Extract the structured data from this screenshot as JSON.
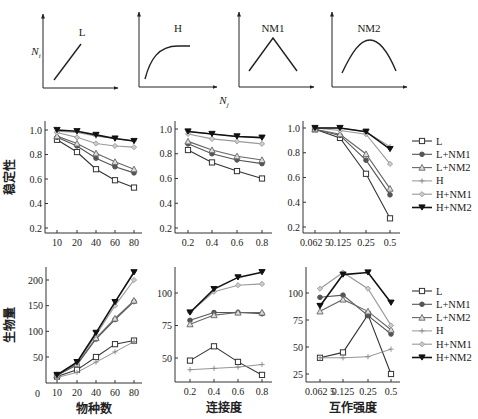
{
  "top_panels": {
    "ylabel": "N_i",
    "xlabel": "N_j",
    "panels": [
      {
        "label": "L",
        "shape": "linear"
      },
      {
        "label": "H",
        "shape": "saturating"
      },
      {
        "label": "NM1",
        "shape": "triangle"
      },
      {
        "label": "NM2",
        "shape": "hump"
      }
    ]
  },
  "legend": [
    {
      "name": "L",
      "marker": "square-open",
      "color": "#333333"
    },
    {
      "name": "L+NM1",
      "marker": "circle",
      "color": "#555555"
    },
    {
      "name": "L+NM2",
      "marker": "triangle-open",
      "color": "#666666"
    },
    {
      "name": "H",
      "marker": "cross",
      "color": "#888888"
    },
    {
      "name": "H+NM1",
      "marker": "diamond",
      "color": "#999999"
    },
    {
      "name": "H+NM2",
      "marker": "triangle-down",
      "color": "#111111"
    }
  ],
  "chart_data": [
    {
      "type": "line",
      "title": "",
      "xlabel": "",
      "ylabel": "稳定性",
      "categories": [
        "10",
        "20",
        "40",
        "60",
        "80"
      ],
      "ylim": [
        0.2,
        1.05
      ],
      "yticks": [
        "0.2",
        "0.4",
        "0.6",
        "0.8",
        "1.0"
      ],
      "series": [
        {
          "name": "L",
          "values": [
            0.92,
            0.82,
            0.68,
            0.59,
            0.53
          ]
        },
        {
          "name": "L+NM1",
          "values": [
            0.94,
            0.87,
            0.77,
            0.7,
            0.65
          ]
        },
        {
          "name": "L+NM2",
          "values": [
            0.95,
            0.89,
            0.81,
            0.74,
            0.68
          ]
        },
        {
          "name": "H",
          "values": [
            0.99,
            0.98,
            0.95,
            0.93,
            0.91
          ]
        },
        {
          "name": "H+NM1",
          "values": [
            0.98,
            0.94,
            0.89,
            0.87,
            0.86
          ]
        },
        {
          "name": "H+NM2",
          "values": [
            1.0,
            0.99,
            0.96,
            0.93,
            0.91
          ]
        }
      ]
    },
    {
      "type": "line",
      "title": "",
      "xlabel": "",
      "ylabel": "",
      "categories": [
        "0.2",
        "0.4",
        "0.6",
        "0.8"
      ],
      "ylim": [
        0.2,
        1.05
      ],
      "yticks": [
        "0.2",
        "0.4",
        "0.6",
        "0.8",
        "1.0"
      ],
      "series": [
        {
          "name": "L",
          "values": [
            0.83,
            0.73,
            0.66,
            0.6
          ]
        },
        {
          "name": "L+NM1",
          "values": [
            0.88,
            0.8,
            0.75,
            0.72
          ]
        },
        {
          "name": "L+NM2",
          "values": [
            0.9,
            0.83,
            0.78,
            0.75
          ]
        },
        {
          "name": "H",
          "values": [
            0.98,
            0.96,
            0.94,
            0.93
          ]
        },
        {
          "name": "H+NM1",
          "values": [
            0.96,
            0.92,
            0.9,
            0.88
          ]
        },
        {
          "name": "H+NM2",
          "values": [
            0.98,
            0.96,
            0.94,
            0.93
          ]
        }
      ]
    },
    {
      "type": "line",
      "title": "",
      "xlabel": "",
      "ylabel": "",
      "categories": [
        "0.062 5",
        "0.125",
        "0.25",
        "0.5"
      ],
      "ylim": [
        0.2,
        1.05
      ],
      "yticks": [
        "0.2",
        "0.4",
        "0.6",
        "0.8",
        "1.0"
      ],
      "series": [
        {
          "name": "L",
          "values": [
            0.99,
            0.92,
            0.63,
            0.27
          ]
        },
        {
          "name": "L+NM1",
          "values": [
            0.99,
            0.94,
            0.74,
            0.46
          ]
        },
        {
          "name": "L+NM2",
          "values": [
            0.99,
            0.95,
            0.79,
            0.51
          ]
        },
        {
          "name": "H",
          "values": [
            1.0,
            1.0,
            0.97,
            0.85
          ]
        },
        {
          "name": "H+NM1",
          "values": [
            1.0,
            0.98,
            0.95,
            0.71
          ]
        },
        {
          "name": "H+NM2",
          "values": [
            1.0,
            1.0,
            0.97,
            0.83
          ]
        }
      ]
    },
    {
      "type": "line",
      "title": "",
      "xlabel": "物种数",
      "ylabel": "生物量",
      "categories": [
        "10",
        "20",
        "40",
        "60",
        "80"
      ],
      "ylim": [
        0,
        225
      ],
      "yticks": [
        "50",
        "100",
        "150",
        "200"
      ],
      "origin_label": "0",
      "series": [
        {
          "name": "L",
          "values": [
            12,
            25,
            50,
            75,
            82
          ]
        },
        {
          "name": "L+NM1",
          "values": [
            14,
            35,
            85,
            123,
            158
          ]
        },
        {
          "name": "L+NM2",
          "values": [
            15,
            36,
            87,
            125,
            160
          ]
        },
        {
          "name": "H",
          "values": [
            10,
            20,
            40,
            60,
            80
          ]
        },
        {
          "name": "H+NM1",
          "values": [
            15,
            38,
            93,
            150,
            200
          ]
        },
        {
          "name": "H+NM2",
          "values": [
            15,
            40,
            97,
            157,
            215
          ]
        }
      ]
    },
    {
      "type": "line",
      "title": "",
      "xlabel": "连接度",
      "ylabel": "",
      "categories": [
        "0.2",
        "0.4",
        "0.6",
        "0.8"
      ],
      "ylim": [
        32,
        120
      ],
      "yticks": [
        "50",
        "75",
        "100"
      ],
      "series": [
        {
          "name": "L",
          "values": [
            48,
            59,
            47,
            37
          ]
        },
        {
          "name": "L+NM1",
          "values": [
            79,
            85,
            85,
            84
          ]
        },
        {
          "name": "L+NM2",
          "values": [
            76,
            83,
            85,
            85
          ]
        },
        {
          "name": "H",
          "values": [
            41,
            42,
            43,
            45
          ]
        },
        {
          "name": "H+NM1",
          "values": [
            85,
            101,
            106,
            107
          ]
        },
        {
          "name": "H+NM2",
          "values": [
            85,
            103,
            112,
            116
          ]
        }
      ]
    },
    {
      "type": "line",
      "title": "",
      "xlabel": "互作强度",
      "ylabel": "",
      "categories": [
        "0.062 5",
        "0.125",
        "0.25",
        "0.5"
      ],
      "ylim": [
        20,
        125
      ],
      "yticks": [
        "25",
        "50",
        "75",
        "100"
      ],
      "series": [
        {
          "name": "L",
          "values": [
            40,
            45,
            80,
            25
          ]
        },
        {
          "name": "L+NM1",
          "values": [
            96,
            98,
            79,
            62
          ]
        },
        {
          "name": "L+NM2",
          "values": [
            83,
            94,
            83,
            66
          ]
        },
        {
          "name": "H",
          "values": [
            40,
            40,
            41,
            48
          ]
        },
        {
          "name": "H+NM1",
          "values": [
            104,
            119,
            104,
            70
          ]
        },
        {
          "name": "H+NM2",
          "values": [
            88,
            117,
            119,
            91
          ]
        }
      ]
    }
  ]
}
